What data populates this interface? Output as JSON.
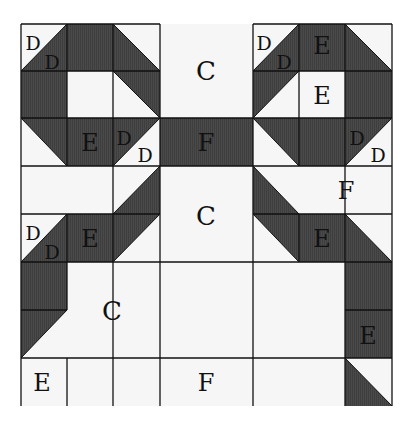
{
  "diagram": {
    "colors": {
      "dark": "#4a4a4a",
      "light": "#f6f6f6",
      "line": "#111111"
    },
    "grid": {
      "x": [
        21,
        67,
        113,
        160,
        206,
        253,
        299,
        345,
        392
      ],
      "y": [
        24,
        71,
        118,
        166,
        214,
        262,
        310,
        358,
        406
      ]
    },
    "cells": [
      {
        "c": 0,
        "r": 0,
        "fill": "tri",
        "dark": "br"
      },
      {
        "c": 1,
        "r": 0,
        "fill": "dark"
      },
      {
        "c": 2,
        "r": 0,
        "fill": "tri",
        "dark": "bl"
      },
      {
        "c": 5,
        "r": 0,
        "fill": "tri",
        "dark": "br"
      },
      {
        "c": 6,
        "r": 0,
        "fill": "dark"
      },
      {
        "c": 7,
        "r": 0,
        "fill": "tri",
        "dark": "bl"
      },
      {
        "c": 0,
        "r": 1,
        "fill": "dark"
      },
      {
        "c": 2,
        "r": 1,
        "fill": "tri",
        "dark": "tr"
      },
      {
        "c": 5,
        "r": 1,
        "fill": "tri",
        "dark": "tl"
      },
      {
        "c": 7,
        "r": 1,
        "fill": "dark"
      },
      {
        "c": 0,
        "r": 2,
        "fill": "tri",
        "dark": "tr"
      },
      {
        "c": 1,
        "r": 2,
        "fill": "dark"
      },
      {
        "c": 2,
        "r": 2,
        "fill": "tri",
        "dark": "tl"
      },
      {
        "c": 3,
        "r": 2,
        "fill": "dark",
        "w": 2
      },
      {
        "c": 5,
        "r": 2,
        "fill": "tri",
        "dark": "tr"
      },
      {
        "c": 6,
        "r": 2,
        "fill": "dark"
      },
      {
        "c": 7,
        "r": 2,
        "fill": "tri",
        "dark": "tl"
      },
      {
        "c": 2,
        "r": 3,
        "fill": "tri",
        "dark": "br"
      },
      {
        "c": 5,
        "r": 3,
        "fill": "tri",
        "dark": "bl"
      },
      {
        "c": 0,
        "r": 4,
        "fill": "tri",
        "dark": "br"
      },
      {
        "c": 1,
        "r": 4,
        "fill": "dark"
      },
      {
        "c": 2,
        "r": 4,
        "fill": "tri",
        "dark": "tl"
      },
      {
        "c": 5,
        "r": 4,
        "fill": "tri",
        "dark": "tr"
      },
      {
        "c": 6,
        "r": 4,
        "fill": "dark"
      },
      {
        "c": 7,
        "r": 4,
        "fill": "tri",
        "dark": "bl"
      },
      {
        "c": 0,
        "r": 5,
        "fill": "dark"
      },
      {
        "c": 7,
        "r": 5,
        "fill": "dark"
      },
      {
        "c": 0,
        "r": 6,
        "fill": "tri",
        "dark": "tl"
      },
      {
        "c": 7,
        "r": 6,
        "fill": "dark"
      },
      {
        "c": 7,
        "r": 7,
        "fill": "tri",
        "dark": "bl"
      }
    ],
    "lines": [
      [
        21,
        24,
        21,
        406
      ],
      [
        67,
        24,
        67,
        166
      ],
      [
        67,
        214,
        67,
        310
      ],
      [
        113,
        24,
        113,
        406
      ],
      [
        160,
        24,
        160,
        406
      ],
      [
        253,
        24,
        253,
        406
      ],
      [
        299,
        24,
        299,
        166
      ],
      [
        299,
        214,
        299,
        262
      ],
      [
        345,
        24,
        345,
        406
      ],
      [
        392,
        24,
        392,
        406
      ],
      [
        21,
        24,
        160,
        24
      ],
      [
        253,
        24,
        392,
        24
      ],
      [
        21,
        71,
        160,
        71
      ],
      [
        253,
        71,
        392,
        71
      ],
      [
        21,
        118,
        392,
        118
      ],
      [
        21,
        166,
        392,
        166
      ],
      [
        21,
        214,
        160,
        214
      ],
      [
        253,
        214,
        392,
        214
      ],
      [
        21,
        262,
        392,
        262
      ],
      [
        21,
        310,
        67,
        310
      ],
      [
        345,
        310,
        392,
        310
      ],
      [
        21,
        358,
        392,
        358
      ],
      [
        67,
        358,
        67,
        406
      ]
    ],
    "labels": [
      {
        "text": "D",
        "x": 33,
        "y": 50,
        "size": 19
      },
      {
        "text": "D",
        "x": 52,
        "y": 69,
        "size": 19
      },
      {
        "text": "C",
        "x": 206,
        "y": 80,
        "size": 26
      },
      {
        "text": "D",
        "x": 264,
        "y": 50,
        "size": 19
      },
      {
        "text": "D",
        "x": 284,
        "y": 69,
        "size": 19
      },
      {
        "text": "E",
        "x": 322,
        "y": 54,
        "size": 24
      },
      {
        "text": "E",
        "x": 322,
        "y": 104,
        "size": 24
      },
      {
        "text": "E",
        "x": 90,
        "y": 151,
        "size": 24
      },
      {
        "text": "D",
        "x": 124,
        "y": 145,
        "size": 19
      },
      {
        "text": "D",
        "x": 145,
        "y": 162,
        "size": 19
      },
      {
        "text": "F",
        "x": 206,
        "y": 151,
        "size": 24
      },
      {
        "text": "D",
        "x": 357,
        "y": 145,
        "size": 19
      },
      {
        "text": "D",
        "x": 378,
        "y": 162,
        "size": 19
      },
      {
        "text": "F",
        "x": 346,
        "y": 199,
        "size": 24
      },
      {
        "text": "C",
        "x": 206,
        "y": 225,
        "size": 26
      },
      {
        "text": "D",
        "x": 33,
        "y": 240,
        "size": 19
      },
      {
        "text": "D",
        "x": 52,
        "y": 259,
        "size": 19
      },
      {
        "text": "E",
        "x": 90,
        "y": 247,
        "size": 24
      },
      {
        "text": "E",
        "x": 322,
        "y": 247,
        "size": 24
      },
      {
        "text": "C",
        "x": 112,
        "y": 320,
        "size": 26
      },
      {
        "text": "E",
        "x": 368,
        "y": 344,
        "size": 24
      },
      {
        "text": "E",
        "x": 42,
        "y": 391,
        "size": 24
      },
      {
        "text": "F",
        "x": 206,
        "y": 391,
        "size": 24
      }
    ]
  }
}
